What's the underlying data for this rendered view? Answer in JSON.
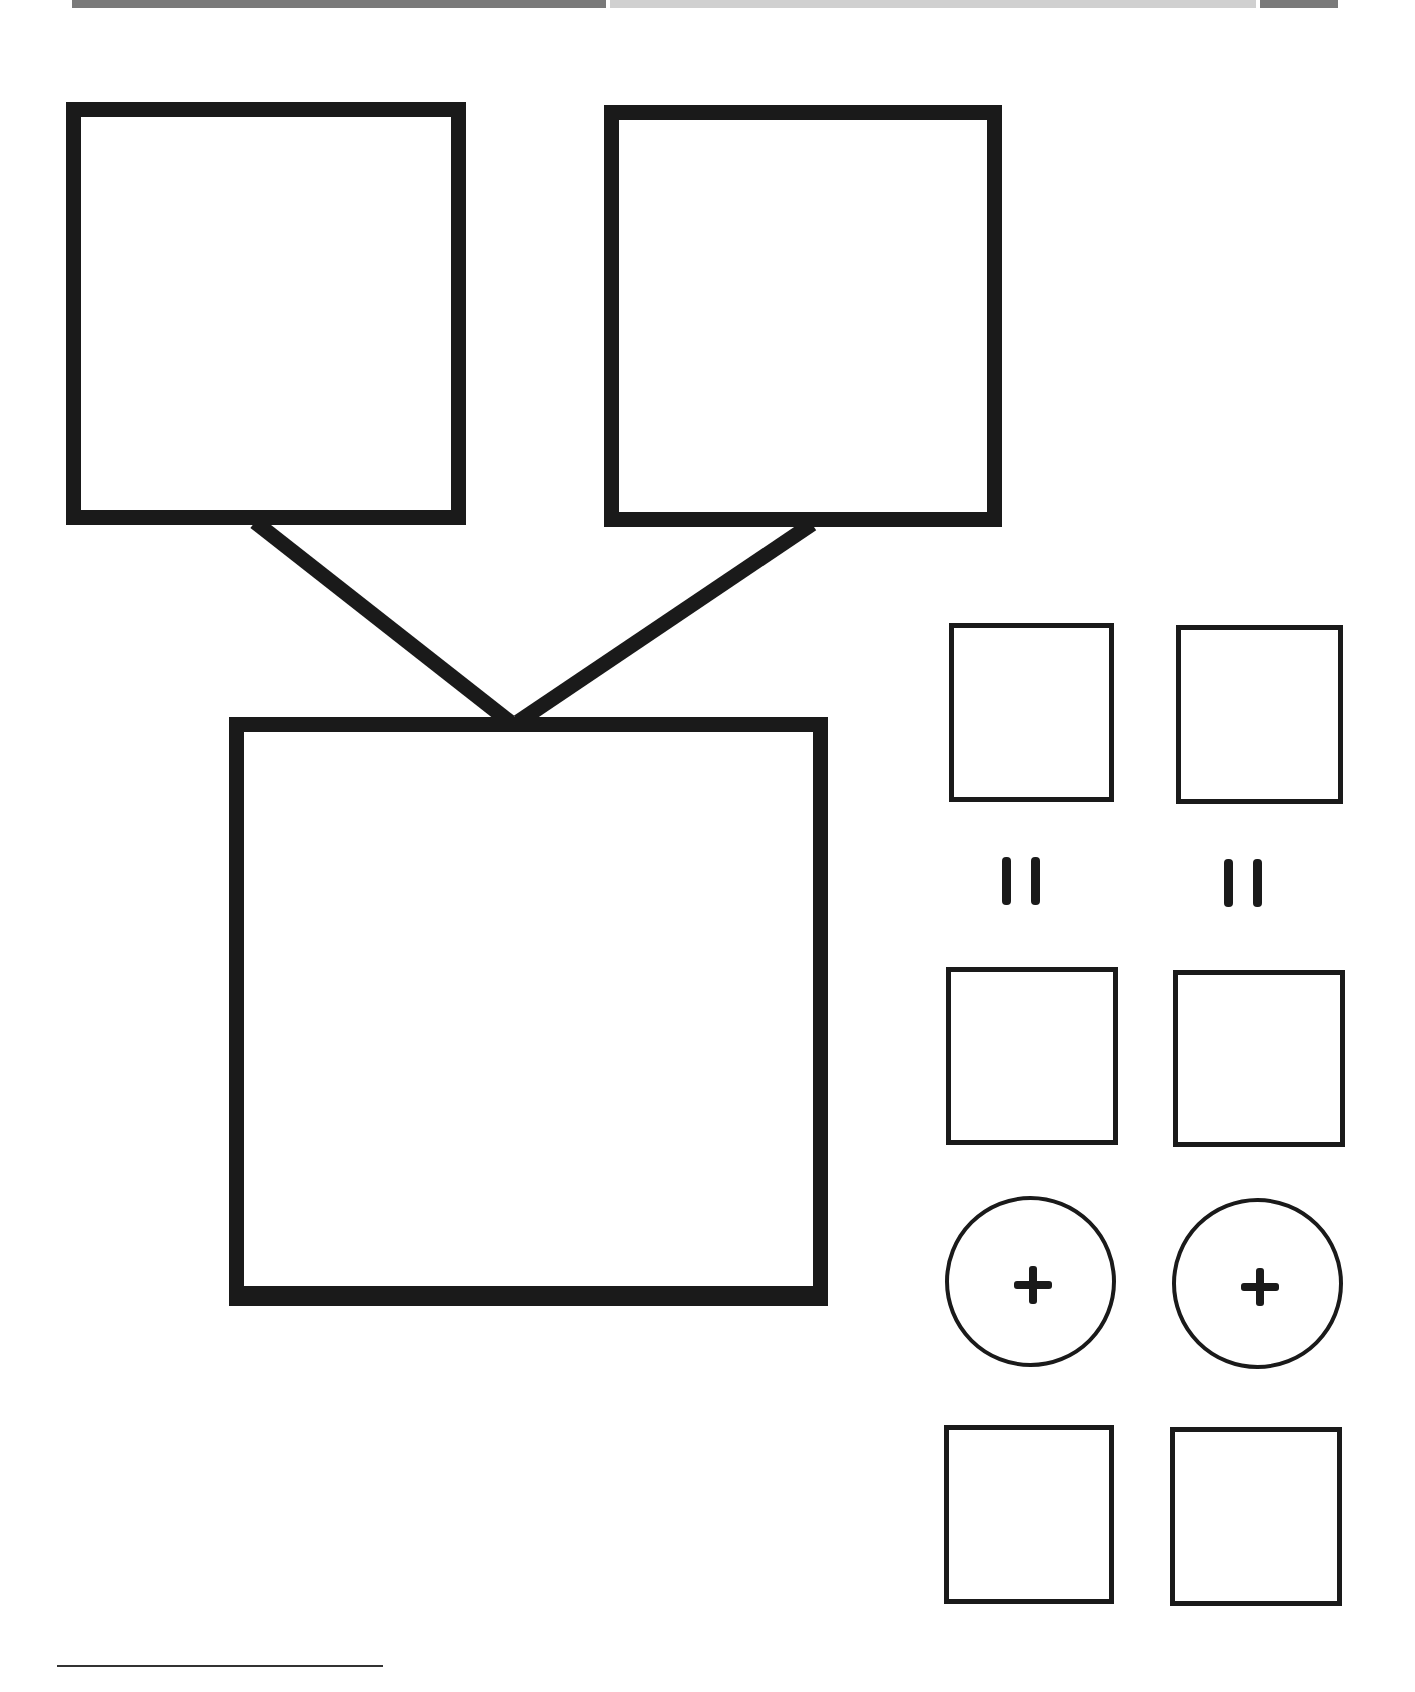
{
  "diagram": {
    "type": "worksheet-composition",
    "colors": {
      "stroke": "#1a1a1a",
      "topbar_dark": "#7a7a7a",
      "topbar_light": "#d0d0d0",
      "background": "#ffffff"
    },
    "top_bars": [
      {
        "name": "dark-bar-left",
        "x": 72,
        "width": 534
      },
      {
        "name": "light-bar-middle",
        "x": 610,
        "width": 646
      },
      {
        "name": "dark-bar-right",
        "x": 1260,
        "width": 78
      }
    ],
    "part_boxes": [
      {
        "name": "part-box-left",
        "x": 66,
        "y": 102,
        "w": 400,
        "h": 423
      },
      {
        "name": "part-box-right",
        "x": 604,
        "y": 105,
        "w": 398,
        "h": 422
      }
    ],
    "whole_box": {
      "name": "whole-box",
      "x": 229,
      "y": 717,
      "w": 599,
      "h": 589
    },
    "connectors": [
      {
        "from": [
          255,
          525
        ],
        "to": [
          507,
          718
        ]
      },
      {
        "from": [
          810,
          527
        ],
        "to": [
          520,
          718
        ]
      }
    ],
    "equation_columns": [
      {
        "top_box": {
          "x": 949,
          "y": 623,
          "w": 165,
          "h": 179
        },
        "equals_symbol": "=",
        "bottom_box": {
          "x": 946,
          "y": 967,
          "w": 172,
          "h": 178
        },
        "operator_symbol": "+",
        "result_box": {
          "x": 944,
          "y": 1425,
          "w": 170,
          "h": 179
        }
      },
      {
        "top_box": {
          "x": 1176,
          "y": 625,
          "w": 167,
          "h": 179
        },
        "equals_symbol": "=",
        "bottom_box": {
          "x": 1173,
          "y": 970,
          "w": 172,
          "h": 177
        },
        "operator_symbol": "+",
        "result_box": {
          "x": 1170,
          "y": 1427,
          "w": 172,
          "h": 179
        }
      }
    ],
    "footer": {
      "rule": true,
      "footnote_text": ""
    }
  }
}
